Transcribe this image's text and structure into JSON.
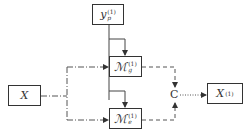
{
  "diagram": {
    "nodes": {
      "yp": {
        "base": "y",
        "sup": "(1)",
        "sub": "p"
      },
      "mg": {
        "base": "ℳ",
        "sup": "(1)",
        "sub": "g"
      },
      "me": {
        "base": "ℳ",
        "sup": "(1)",
        "sub": "e"
      },
      "x": {
        "label": "X"
      },
      "c": {
        "label": "C"
      },
      "x1": {
        "base": "X",
        "sup": "(1)"
      }
    },
    "edges": [
      {
        "from": "yp",
        "to": "mg",
        "style": "solid"
      },
      {
        "from": "yp",
        "to": "me",
        "style": "solid"
      },
      {
        "from": "x",
        "to": "mg",
        "style": "dash-dot"
      },
      {
        "from": "x",
        "to": "me",
        "style": "dash-dot"
      },
      {
        "from": "mg",
        "to": "c",
        "style": "dashed"
      },
      {
        "from": "me",
        "to": "c",
        "style": "dashed"
      },
      {
        "from": "c",
        "to": "x1",
        "style": "dotted"
      }
    ],
    "colors": {
      "stroke": "#333333",
      "background": "#ffffff"
    }
  }
}
